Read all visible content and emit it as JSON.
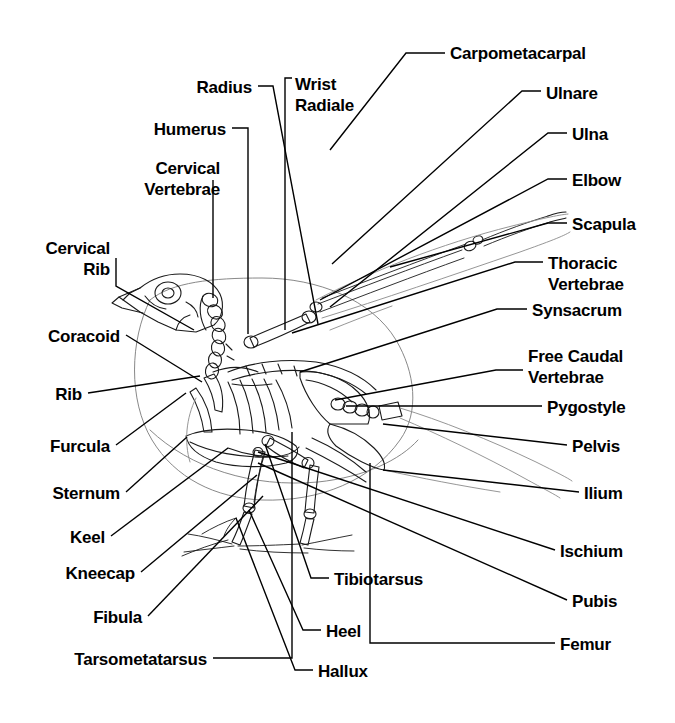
{
  "diagram": {
    "background_color": "#ffffff",
    "line_color": "#000000",
    "label_color": "#000000",
    "width": 675,
    "height": 723
  },
  "labels": [
    {
      "id": "carpometacarpal",
      "text": "Carpometacarpal",
      "align": "left",
      "x": 450,
      "y": 44,
      "lines": [
        "Carpometacarpal"
      ]
    },
    {
      "id": "radius",
      "text": "Radius",
      "align": "right",
      "x": 252,
      "y": 78,
      "lines": [
        "Radius"
      ]
    },
    {
      "id": "wrist-radiale",
      "text": "Wrist Radiale",
      "align": "left",
      "x": 295,
      "y": 74,
      "lines": [
        "Wrist",
        "Radiale"
      ]
    },
    {
      "id": "ulnare",
      "text": "Ulnare",
      "align": "left",
      "x": 546,
      "y": 84,
      "lines": [
        "Ulnare"
      ]
    },
    {
      "id": "humerus",
      "text": "Humerus",
      "align": "right",
      "x": 226,
      "y": 120,
      "lines": [
        "Humerus"
      ]
    },
    {
      "id": "ulna",
      "text": "Ulna",
      "align": "left",
      "x": 572,
      "y": 125,
      "lines": [
        "Ulna"
      ]
    },
    {
      "id": "cervical-vertebrae",
      "text": "Cervical Vertebrae",
      "align": "right",
      "x": 220,
      "y": 158,
      "lines": [
        "Cervical",
        "Vertebrae"
      ]
    },
    {
      "id": "elbow",
      "text": "Elbow",
      "align": "left",
      "x": 572,
      "y": 171,
      "lines": [
        "Elbow"
      ]
    },
    {
      "id": "scapula",
      "text": "Scapula",
      "align": "left",
      "x": 572,
      "y": 215,
      "lines": [
        "Scapula"
      ]
    },
    {
      "id": "cervical-rib",
      "text": "Cervical Rib",
      "align": "right",
      "x": 110,
      "y": 238,
      "lines": [
        "Cervical",
        "Rib"
      ]
    },
    {
      "id": "thoracic-vertebrae",
      "text": "Thoracic Vertebrae",
      "align": "left",
      "x": 548,
      "y": 253,
      "lines": [
        "Thoracic",
        "Vertebrae"
      ]
    },
    {
      "id": "synsacrum",
      "text": "Synsacrum",
      "align": "left",
      "x": 532,
      "y": 301,
      "lines": [
        "Synsacrum"
      ]
    },
    {
      "id": "coracoid",
      "text": "Coracoid",
      "align": "right",
      "x": 120,
      "y": 327,
      "lines": [
        "Coracoid"
      ]
    },
    {
      "id": "free-caudal-vertebrae",
      "text": "Free Caudal Vertebrae",
      "align": "left",
      "x": 528,
      "y": 346,
      "lines": [
        "Free Caudal",
        "Vertebrae"
      ]
    },
    {
      "id": "rib",
      "text": "Rib",
      "align": "right",
      "x": 82,
      "y": 385,
      "lines": [
        "Rib"
      ]
    },
    {
      "id": "pygostyle",
      "text": "Pygostyle",
      "align": "left",
      "x": 547,
      "y": 398,
      "lines": [
        "Pygostyle"
      ]
    },
    {
      "id": "furcula",
      "text": "Furcula",
      "align": "right",
      "x": 110,
      "y": 437,
      "lines": [
        "Furcula"
      ]
    },
    {
      "id": "pelvis",
      "text": "Pelvis",
      "align": "left",
      "x": 572,
      "y": 437,
      "lines": [
        "Pelvis"
      ]
    },
    {
      "id": "sternum",
      "text": "Sternum",
      "align": "right",
      "x": 120,
      "y": 484,
      "lines": [
        "Sternum"
      ]
    },
    {
      "id": "ilium",
      "text": "Ilium",
      "align": "left",
      "x": 584,
      "y": 484,
      "lines": [
        "Ilium"
      ]
    },
    {
      "id": "keel",
      "text": "Keel",
      "align": "right",
      "x": 105,
      "y": 528,
      "lines": [
        "Keel"
      ]
    },
    {
      "id": "ischium",
      "text": "Ischium",
      "align": "left",
      "x": 560,
      "y": 542,
      "lines": [
        "Ischium"
      ]
    },
    {
      "id": "kneecap",
      "text": "Kneecap",
      "align": "right",
      "x": 135,
      "y": 564,
      "lines": [
        "Kneecap"
      ]
    },
    {
      "id": "tibiotarsus",
      "text": "Tibiotarsus",
      "align": "left",
      "x": 334,
      "y": 570,
      "lines": [
        "Tibiotarsus"
      ]
    },
    {
      "id": "fibula",
      "text": "Fibula",
      "align": "right",
      "x": 142,
      "y": 608,
      "lines": [
        "Fibula"
      ]
    },
    {
      "id": "pubis",
      "text": "Pubis",
      "align": "left",
      "x": 572,
      "y": 592,
      "lines": [
        "Pubis"
      ]
    },
    {
      "id": "heel",
      "text": "Heel",
      "align": "left",
      "x": 326,
      "y": 622,
      "lines": [
        "Heel"
      ]
    },
    {
      "id": "femur",
      "text": "Femur",
      "align": "left",
      "x": 560,
      "y": 635,
      "lines": [
        "Femur"
      ]
    },
    {
      "id": "tarsometatarsus",
      "text": "Tarsometatarsus",
      "align": "right",
      "x": 207,
      "y": 650,
      "lines": [
        "Tarsometatarsus"
      ]
    },
    {
      "id": "hallux",
      "text": "Hallux",
      "align": "left",
      "x": 318,
      "y": 662,
      "lines": [
        "Hallux"
      ]
    }
  ],
  "leader_lines": [
    {
      "for": "carpometacarpal",
      "points": "445,53 406,53 330,150"
    },
    {
      "for": "radius",
      "points": "258,86 273,86 318,324"
    },
    {
      "for": "wrist-radiale",
      "points": "292,78 285,78 285,330"
    },
    {
      "for": "ulnare",
      "points": "541,91 522,91 332,264"
    },
    {
      "for": "humerus",
      "points": "232,128 248,128 248,334"
    },
    {
      "for": "ulna",
      "points": "567,133 548,133 330,307"
    },
    {
      "for": "cervical-vertebrae",
      "points": "213,180 213,298"
    },
    {
      "for": "elbow",
      "points": "567,179 548,179 320,300"
    },
    {
      "for": "scapula",
      "points": "567,223 548,223 390,267"
    },
    {
      "for": "cervical-rib",
      "points": "116,258 116,286 194,330"
    },
    {
      "for": "thoracic-vertebrae",
      "points": "543,262 515,262 292,333"
    },
    {
      "for": "synsacrum",
      "points": "527,309 497,309 300,372"
    },
    {
      "for": "coracoid",
      "points": "126,335 202,382"
    },
    {
      "for": "free-caudal-vertebrae",
      "points": "523,370 496,370 335,400"
    },
    {
      "for": "rib",
      "points": "88,393 200,376"
    },
    {
      "for": "pygostyle",
      "points": "542,406 346,406"
    },
    {
      "for": "furcula",
      "points": "116,445 186,393"
    },
    {
      "for": "pelvis",
      "points": "567,445 383,424"
    },
    {
      "for": "sternum",
      "points": "126,492 187,437"
    },
    {
      "for": "ilium",
      "points": "579,492 383,470"
    },
    {
      "for": "keel",
      "points": "111,536 228,448"
    },
    {
      "for": "ischium",
      "points": "555,550 258,452"
    },
    {
      "for": "kneecap",
      "points": "141,572 257,475"
    },
    {
      "for": "tibiotarsus",
      "points": "329,578 311,578 265,444"
    },
    {
      "for": "fibula",
      "points": "148,616 263,496"
    },
    {
      "for": "pubis",
      "points": "567,600 258,463"
    },
    {
      "for": "heel",
      "points": "321,630 303,630 249,510"
    },
    {
      "for": "femur",
      "points": "555,643 370,643 370,463"
    },
    {
      "for": "tarsometatarsus",
      "points": "213,658 292,658 292,432"
    },
    {
      "for": "hallux",
      "points": "313,670 295,670 236,518"
    }
  ]
}
